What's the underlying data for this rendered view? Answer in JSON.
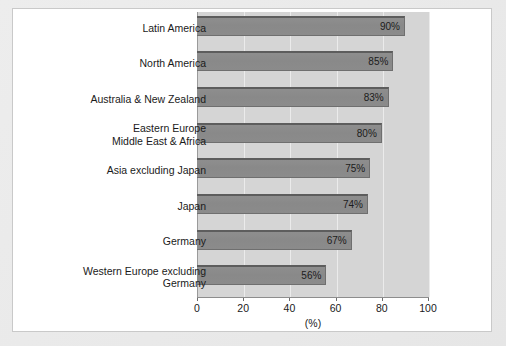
{
  "chart_data": {
    "type": "bar",
    "orientation": "horizontal",
    "title": "",
    "xlabel": "(%)",
    "ylabel": "",
    "xlim": [
      0,
      100
    ],
    "xticks": [
      0,
      20,
      40,
      60,
      80,
      100
    ],
    "xtick_labels": [
      "0",
      "20",
      "40",
      "60",
      "80",
      "100"
    ],
    "grid": true,
    "grid_axis": "x",
    "legend": false,
    "categories": [
      "Latin America",
      "North America",
      "Australia & New Zealand",
      "Eastern Europe\nMiddle East & Africa",
      "Asia excluding Japan",
      "Japan",
      "Germany",
      "Western Europe excluding\nGermany"
    ],
    "values": [
      90,
      85,
      83,
      80,
      75,
      74,
      67,
      56
    ],
    "value_labels": [
      "90%",
      "85%",
      "83%",
      "80%",
      "75%",
      "74%",
      "67%",
      "56%"
    ],
    "colors": {
      "bar_fill": "#8b8b8b",
      "bar_edge": "#5d5d5d",
      "plot_background": "#d5d5d5",
      "gridline": "#ebebeb",
      "axis": "#8d8d8d",
      "text": "#1a1a1a",
      "card_background": "#ffffff",
      "page_background": "#e9e9e9"
    }
  }
}
